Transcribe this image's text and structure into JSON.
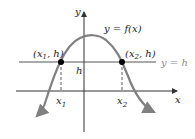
{
  "diagram": {
    "axis_labels": {
      "x": "x",
      "y": "y"
    },
    "curve_label": "y = f(x)",
    "line_label": "y = h",
    "h_label": "h",
    "points": [
      {
        "label_prefix": "(x",
        "sub": "1",
        "label_suffix": ", h)"
      },
      {
        "label_prefix": "(x",
        "sub": "2",
        "label_suffix": ", h)"
      }
    ],
    "x_ticks": [
      {
        "base": "x",
        "sub": "1"
      },
      {
        "base": "x",
        "sub": "2"
      }
    ],
    "colors": {
      "curve": "#808080",
      "axes": "#333333",
      "line": "#555555",
      "point": "#000000",
      "label_grey": "#8a8a8a"
    }
  }
}
